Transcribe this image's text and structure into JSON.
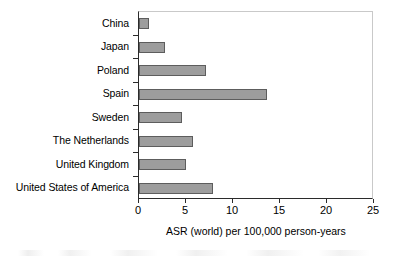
{
  "chart_data": {
    "type": "bar",
    "orientation": "horizontal",
    "title": "",
    "subtitle": "",
    "xlabel": "ASR (world) per 100,000 person-years",
    "ylabel": "",
    "categories": [
      "China",
      "Japan",
      "Poland",
      "Spain",
      "Sweden",
      "The Netherlands",
      "United Kingdom",
      "United States of America"
    ],
    "values": [
      1.1,
      2.8,
      7.1,
      13.6,
      4.6,
      5.7,
      5.0,
      7.9
    ],
    "xlim": [
      0,
      25
    ],
    "xticks": [
      0,
      5,
      10,
      15,
      20,
      25
    ],
    "xtick_labels": [
      "0",
      "5",
      "10",
      "15",
      "20",
      "25"
    ],
    "grid": false,
    "legend": null,
    "bar_fill_color": "#9d9d9d",
    "bar_border_color": "#5d5d5d",
    "axis_color": "#2b2b2b",
    "plot_background": "#ffffff"
  }
}
